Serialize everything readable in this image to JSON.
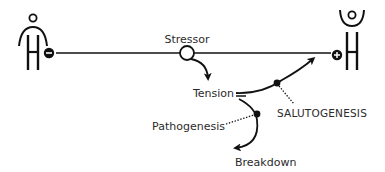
{
  "diagram": {
    "colors": {
      "stroke": "#111111",
      "text": "#2b2b2b",
      "background": "#ffffff"
    },
    "left_figure": {
      "icon": "person-ease-minus-icon",
      "badge": "minus"
    },
    "right_figure": {
      "icon": "person-ease-plus-icon",
      "badge": "plus"
    },
    "labels": {
      "stressor": "Stressor",
      "tension": "Tension",
      "salutogenesis": "SALUTOGENESIS",
      "pathogenesis": "Pathogenesis",
      "breakdown": "Breakdown"
    }
  }
}
